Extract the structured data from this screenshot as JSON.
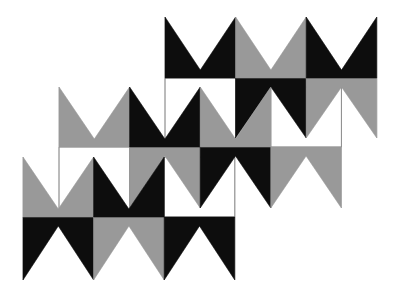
{
  "colors": {
    "black": "#0d0d0d",
    "gray": "#999999",
    "white": "#ffffff",
    "outline": "#8a8a8a",
    "background": "#ffffff"
  },
  "cell_width": 70.6,
  "valley_depth": 8,
  "peak_height": 9,
  "bands": [
    {
      "name": "band-top",
      "x0": 165,
      "yT": 17,
      "yB": 78,
      "yH": 138,
      "m": [
        "black",
        "gray",
        "black"
      ],
      "w": [
        "white",
        "black",
        "gray"
      ]
    },
    {
      "name": "band-middle",
      "x0": 59,
      "yT": 87,
      "yB": 147,
      "yH": 208,
      "m": [
        "gray",
        "black",
        "gray",
        "white"
      ],
      "w": [
        "white",
        "gray",
        "black",
        "gray"
      ]
    },
    {
      "name": "band-bottom",
      "x0": 23,
      "yT": 157,
      "yB": 217,
      "yH": 280,
      "m": [
        "gray",
        "black",
        "white"
      ],
      "w": [
        "black",
        "gray",
        "black"
      ]
    }
  ]
}
